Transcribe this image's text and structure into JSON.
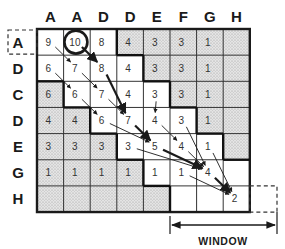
{
  "diagram": {
    "column_headers": [
      "A",
      "A",
      "D",
      "D",
      "E",
      "F",
      "G",
      "H"
    ],
    "row_headers": [
      "A",
      "D",
      "C",
      "D",
      "E",
      "G",
      "H"
    ],
    "cells": [
      [
        "9",
        "10",
        "8",
        "4",
        "3",
        "3",
        "1",
        ""
      ],
      [
        "6",
        "7",
        "8",
        "4",
        "3",
        "3",
        "1",
        ""
      ],
      [
        "6",
        "6",
        "7",
        "4",
        "3",
        "3",
        "1",
        ""
      ],
      [
        "4",
        "4",
        "6",
        "7",
        "4",
        "3",
        "1",
        ""
      ],
      [
        "3",
        "3",
        "3",
        "3",
        "5",
        "4",
        "1",
        ""
      ],
      [
        "1",
        "1",
        "1",
        "1",
        "1",
        "1",
        "4",
        ""
      ],
      [
        "",
        "",
        "",
        "",
        "",
        "",
        "",
        "2"
      ]
    ],
    "shaded": [
      [
        0,
        0,
        0,
        1,
        1,
        1,
        1,
        1
      ],
      [
        0,
        0,
        0,
        0,
        1,
        1,
        1,
        1
      ],
      [
        1,
        0,
        0,
        0,
        0,
        1,
        1,
        1
      ],
      [
        1,
        1,
        0,
        0,
        0,
        0,
        1,
        1
      ],
      [
        1,
        1,
        1,
        0,
        0,
        0,
        0,
        1
      ],
      [
        1,
        1,
        1,
        1,
        0,
        0,
        0,
        0
      ],
      [
        1,
        1,
        1,
        1,
        1,
        0,
        0,
        0
      ]
    ],
    "circled_cell": {
      "row": 0,
      "col": 1,
      "value": "10"
    },
    "start_row_label_boxed": "A",
    "end_cell_boxed": {
      "row": 6,
      "col": 7,
      "value": "2"
    },
    "window_label": "WINDOW",
    "traceback_arrows": [
      {
        "from": [
          0,
          0
        ],
        "to": [
          1,
          1
        ],
        "weight": "thin"
      },
      {
        "from": [
          0,
          1
        ],
        "to": [
          1,
          2
        ],
        "weight": "thick"
      },
      {
        "from": [
          1,
          1
        ],
        "to": [
          2,
          2
        ],
        "weight": "thin"
      },
      {
        "from": [
          1,
          0
        ],
        "to": [
          2,
          1
        ],
        "weight": "thin"
      },
      {
        "from": [
          1,
          2
        ],
        "to": [
          3,
          3
        ],
        "weight": "thick"
      },
      {
        "from": [
          2,
          2
        ],
        "to": [
          3,
          3
        ],
        "weight": "thin"
      },
      {
        "from": [
          2,
          1
        ],
        "to": [
          3,
          2
        ],
        "weight": "thin"
      },
      {
        "from": [
          2,
          4
        ],
        "to": [
          3,
          4
        ],
        "weight": "thin"
      },
      {
        "from": [
          3,
          2
        ],
        "to": [
          4,
          4
        ],
        "weight": "thin"
      },
      {
        "from": [
          3,
          3
        ],
        "to": [
          4,
          4
        ],
        "weight": "thick"
      },
      {
        "from": [
          3,
          4
        ],
        "to": [
          4,
          5
        ],
        "weight": "thin"
      },
      {
        "from": [
          3,
          5
        ],
        "to": [
          5,
          6
        ],
        "weight": "thin"
      },
      {
        "from": [
          4,
          3
        ],
        "to": [
          5,
          6
        ],
        "weight": "thin"
      },
      {
        "from": [
          4,
          4
        ],
        "to": [
          5,
          6
        ],
        "weight": "thick"
      },
      {
        "from": [
          4,
          5
        ],
        "to": [
          5,
          6
        ],
        "weight": "thin"
      },
      {
        "from": [
          4,
          6
        ],
        "to": [
          6,
          7
        ],
        "weight": "thin"
      },
      {
        "from": [
          5,
          5
        ],
        "to": [
          6,
          7
        ],
        "weight": "thin"
      },
      {
        "from": [
          5,
          6
        ],
        "to": [
          6,
          7
        ],
        "weight": "thick"
      }
    ],
    "colors": {
      "line": "#1a1a1a",
      "shade": "#d9d9d9",
      "text": "#333333"
    }
  }
}
